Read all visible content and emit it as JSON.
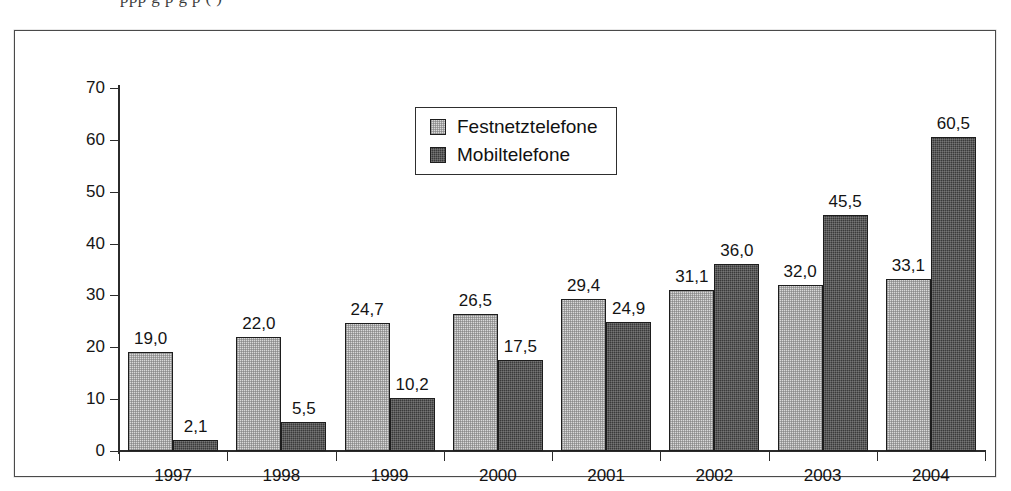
{
  "figure": {
    "frame_border_color": "#4a4a4a",
    "background_color": "#ffffff",
    "top_cut_text": "ppp  g  p  g  p  (  )"
  },
  "legend": {
    "entries": [
      {
        "label": "Festnetztelefone",
        "color": "#d9d9d9",
        "swatch": "light-gray-swatch"
      },
      {
        "label": "Mobiltelefone",
        "color": "#3a3a3a",
        "swatch": "dark-gray-swatch"
      }
    ]
  },
  "axes": {
    "y_ticks": [
      "0",
      "10",
      "20",
      "30",
      "40",
      "50",
      "60",
      "70"
    ],
    "x_ticks": [
      "1997",
      "1998",
      "1999",
      "2000",
      "2001",
      "2002",
      "2003",
      "2004"
    ]
  },
  "chart_data": {
    "type": "bar",
    "title": "",
    "subtitle": "",
    "xlabel": "",
    "ylabel": "",
    "ylim": [
      0,
      70
    ],
    "ytick_step": 10,
    "grid": false,
    "legend_position": "top-center",
    "categories": [
      "1997",
      "1998",
      "1999",
      "2000",
      "2001",
      "2002",
      "2003",
      "2004"
    ],
    "series": [
      {
        "name": "Festnetztelefone",
        "color": "#d9d9d9",
        "values": [
          19.0,
          22.0,
          24.7,
          26.5,
          29.4,
          31.1,
          32.0,
          33.1
        ],
        "labels": [
          "19,0",
          "22,0",
          "24,7",
          "26,5",
          "29,4",
          "31,1",
          "32,0",
          "33,1"
        ]
      },
      {
        "name": "Mobiltelefone",
        "color": "#3a3a3a",
        "values": [
          2.1,
          5.5,
          10.2,
          17.5,
          24.9,
          36.0,
          45.5,
          60.5
        ],
        "labels": [
          "2,1",
          "5,5",
          "10,2",
          "17,5",
          "24,9",
          "36,0",
          "45,5",
          "60,5"
        ]
      }
    ]
  }
}
